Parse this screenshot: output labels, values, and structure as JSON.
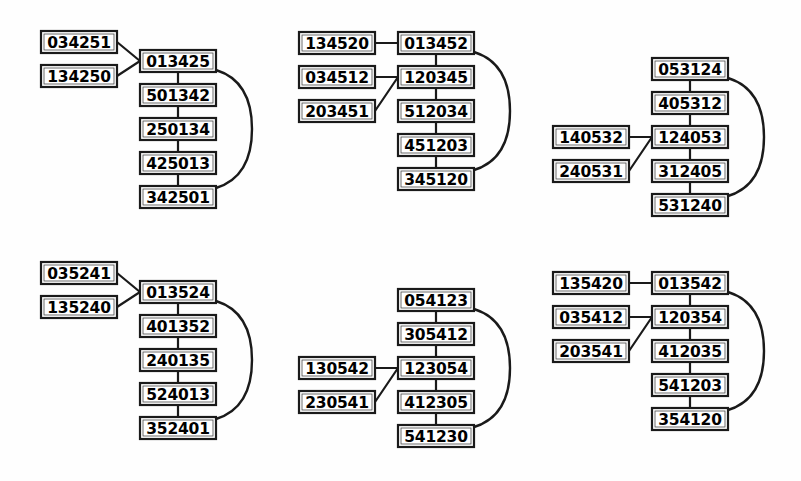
{
  "figure": {
    "background_color": "#fefefe",
    "line_color": "#1a1a1a",
    "box_fill": "#ffffff",
    "width": 801,
    "height": 481,
    "group_count": 6
  },
  "groups": [
    {
      "id": "group-1",
      "position": "top-left",
      "origin_x": 140,
      "origin_y": 50,
      "spine": [
        "013425",
        "501342",
        "250134",
        "425013",
        "342501"
      ],
      "branch_target_index": 0,
      "branch_style": "converge",
      "branches": [
        "034251",
        "134250"
      ],
      "branch_x": 41,
      "branch_y": [
        31,
        65
      ]
    },
    {
      "id": "group-2",
      "position": "top-center",
      "origin_x": 398,
      "origin_y": 32,
      "spine": [
        "013452",
        "120345",
        "512034",
        "451203",
        "345120"
      ],
      "branch_target_index": 1,
      "branch_style": "converge",
      "branches": [
        "034512",
        "203451"
      ],
      "branch_x": 299,
      "branch_y": [
        66,
        100
      ],
      "horizontal_branch": "134520",
      "horizontal_branch_x": 299,
      "horizontal_branch_y": 32
    },
    {
      "id": "group-3",
      "position": "top-right",
      "origin_x": 652,
      "origin_y": 58,
      "spine": [
        "053124",
        "405312",
        "124053",
        "312405",
        "531240"
      ],
      "branch_target_index": 2,
      "branch_style": "converge",
      "branches": [
        "140532",
        "240531"
      ],
      "branch_x": 553,
      "branch_y": [
        126,
        160
      ]
    },
    {
      "id": "group-4",
      "position": "bottom-left",
      "origin_x": 140,
      "origin_y": 281,
      "spine": [
        "013524",
        "401352",
        "240135",
        "524013",
        "352401"
      ],
      "branch_target_index": 0,
      "branch_style": "converge",
      "branches": [
        "035241",
        "135240"
      ],
      "branch_x": 41,
      "branch_y": [
        262,
        296
      ]
    },
    {
      "id": "group-5",
      "position": "bottom-center",
      "origin_x": 398,
      "origin_y": 289,
      "spine": [
        "054123",
        "305412",
        "123054",
        "412305",
        "541230"
      ],
      "branch_target_index": 2,
      "branch_style": "converge",
      "branches": [
        "130542",
        "230541"
      ],
      "branch_x": 299,
      "branch_y": [
        357,
        391
      ]
    },
    {
      "id": "group-6",
      "position": "bottom-right",
      "origin_x": 652,
      "origin_y": 272,
      "spine": [
        "013542",
        "120354",
        "412035",
        "541203",
        "354120"
      ],
      "branch_target_index": 1,
      "branch_style": "converge",
      "branches": [
        "035412",
        "203541"
      ],
      "branch_x": 553,
      "branch_y": [
        306,
        340
      ],
      "horizontal_branch": "135420",
      "horizontal_branch_x": 553,
      "horizontal_branch_y": 272
    }
  ],
  "geometry": {
    "box_width": 76,
    "box_height": 22,
    "row_pitch": 34,
    "curve_bulge": 36
  }
}
